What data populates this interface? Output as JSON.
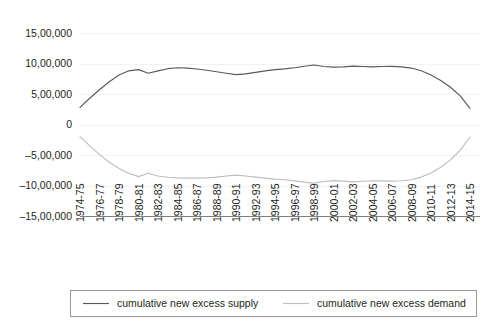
{
  "chart_data": {
    "type": "line",
    "title": "",
    "xlabel": "",
    "ylabel": "",
    "ylim": [
      -1500000,
      1500000
    ],
    "grid": true,
    "legend_position": "bottom",
    "ytick_labels": [
      "15,00,000",
      "10,00,000",
      "5,00,000",
      "0",
      "–5,00,000",
      "–10,00,000",
      "–15,00,000"
    ],
    "ytick_values": [
      1500000,
      1000000,
      500000,
      0,
      -500000,
      -1000000,
      -1500000
    ],
    "categories": [
      "1974-75",
      "1975-76",
      "1976-77",
      "1977-78",
      "1978-79",
      "1979-80",
      "1980-81",
      "1981-82",
      "1982-83",
      "1983-84",
      "1984-85",
      "1985-86",
      "1986-87",
      "1987-88",
      "1988-89",
      "1989-90",
      "1990-91",
      "1991-92",
      "1992-93",
      "1993-94",
      "1994-95",
      "1995-96",
      "1996-97",
      "1997-98",
      "1998-99",
      "1999-00",
      "2000-01",
      "2001-02",
      "2002-03",
      "2003-04",
      "2004-05",
      "2005-06",
      "2006-07",
      "2007-08",
      "2008-09",
      "2009-10",
      "2010-11",
      "2011-12",
      "2012-13",
      "2013-14",
      "2014-15"
    ],
    "xtick_labels": [
      "1974-75",
      "1976-77",
      "1978-79",
      "1980-81",
      "1982-83",
      "1984-85",
      "1986-87",
      "1988-89",
      "1990-91",
      "1992-93",
      "1994-95",
      "1996-97",
      "1998-99",
      "2000-01",
      "2002-03",
      "2004-05",
      "2006-07",
      "2008-09",
      "2010-11",
      "2012-13",
      "2014-15"
    ],
    "series": [
      {
        "name": "cumulative new excess supply",
        "color": "#58595b",
        "values": [
          280000,
          430000,
          570000,
          700000,
          810000,
          880000,
          900000,
          840000,
          880000,
          915000,
          930000,
          925000,
          910000,
          890000,
          865000,
          840000,
          818000,
          830000,
          855000,
          880000,
          900000,
          912000,
          930000,
          955000,
          975000,
          950000,
          940000,
          945000,
          958000,
          950000,
          945000,
          950000,
          952000,
          945000,
          925000,
          880000,
          810000,
          720000,
          610000,
          470000,
          265000
        ]
      },
      {
        "name": "cumulative new excess demand",
        "color": "#bcbec0",
        "values": [
          -200000,
          -350000,
          -490000,
          -620000,
          -720000,
          -800000,
          -855000,
          -800000,
          -845000,
          -865000,
          -875000,
          -880000,
          -880000,
          -875000,
          -862000,
          -845000,
          -830000,
          -845000,
          -862000,
          -880000,
          -895000,
          -905000,
          -925000,
          -945000,
          -960000,
          -935000,
          -920000,
          -928000,
          -940000,
          -930000,
          -922000,
          -925000,
          -928000,
          -922000,
          -905000,
          -862000,
          -795000,
          -700000,
          -580000,
          -420000,
          -205000
        ]
      }
    ],
    "legend": [
      {
        "label": "cumulative new excess supply",
        "color": "#58595b"
      },
      {
        "label": "cumulative new excess demand",
        "color": "#bcbec0"
      }
    ]
  }
}
